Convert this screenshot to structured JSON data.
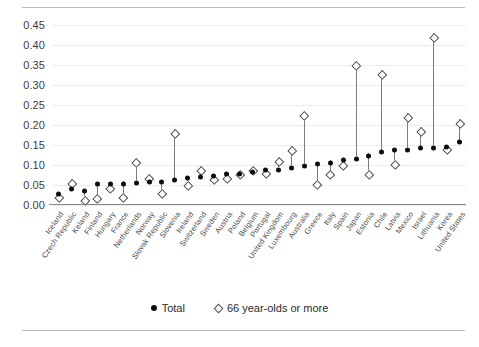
{
  "chart_data": {
    "type": "scatter",
    "title": "",
    "subtitle": "",
    "xlabel": "",
    "ylabel": "",
    "ylim": [
      0.0,
      0.45
    ],
    "ytick_labels": [
      "0.45",
      "0.40",
      "0.35",
      "0.30",
      "0.25",
      "0.20",
      "0.15",
      "0.10",
      "0.05",
      "0.00"
    ],
    "ytick_values": [
      0.45,
      0.4,
      0.35,
      0.3,
      0.25,
      0.2,
      0.15,
      0.1,
      0.05,
      0.0
    ],
    "grid": true,
    "legend_position": "bottom",
    "categories": [
      "Iceland",
      "Czech Republic",
      "Keland",
      "Finland",
      "Hungary",
      "France",
      "Netherlands",
      "Norway",
      "Slovak Republic",
      "Slovenia",
      "Ireland",
      "Switzerland",
      "Sweden",
      "Austria",
      "Poland",
      "Belgium",
      "Portugal",
      "United Kingdom",
      "Luxembourg",
      "Australia",
      "Greece",
      "Italy",
      "Spain",
      "Japan",
      "Estonia",
      "Chile",
      "Latvia",
      "Mexico",
      "Israel",
      "Lithuania",
      "Korea",
      "United States"
    ],
    "series": [
      {
        "name": "Total",
        "marker": "filled-circle",
        "color": "#0d0d0d",
        "values": [
          0.035,
          0.047,
          0.041,
          0.058,
          0.06,
          0.06,
          0.062,
          0.063,
          0.063,
          0.068,
          0.073,
          0.077,
          0.08,
          0.083,
          0.085,
          0.09,
          0.093,
          0.094,
          0.1,
          0.105,
          0.108,
          0.112,
          0.118,
          0.122,
          0.13,
          0.138,
          0.143,
          0.145,
          0.148,
          0.15,
          0.152,
          0.163
        ]
      },
      {
        "name": "66 year-olds or more",
        "marker": "open-diamond",
        "color": "#4a4a4a",
        "values": [
          0.03,
          0.065,
          0.023,
          0.028,
          0.053,
          0.03,
          0.118,
          0.078,
          0.04,
          0.19,
          0.06,
          0.098,
          0.075,
          0.077,
          0.088,
          0.098,
          0.09,
          0.12,
          0.148,
          0.235,
          0.063,
          0.088,
          0.11,
          0.36,
          0.088,
          0.338,
          0.112,
          0.23,
          0.195,
          0.43,
          0.15,
          0.215
        ]
      }
    ]
  },
  "legend": {
    "items": [
      {
        "label": "Total",
        "marker": "filled-circle"
      },
      {
        "label": "66 year-olds or more",
        "marker": "open-diamond"
      }
    ]
  }
}
